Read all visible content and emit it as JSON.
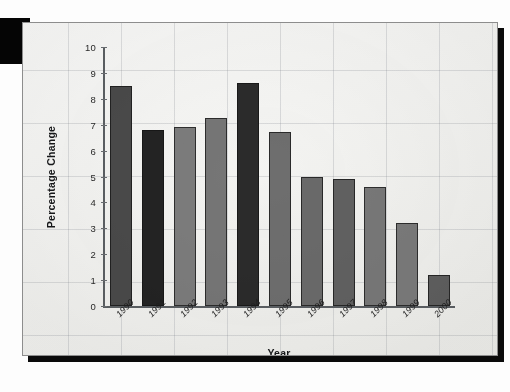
{
  "figure": {
    "title": "",
    "x_axis_label": "Year",
    "y_axis_label": "Percentage Change"
  },
  "chart_data": {
    "type": "bar",
    "title": "",
    "xlabel": "Year",
    "ylabel": "Percentage Change",
    "categories": [
      "1990",
      "1991",
      "1992",
      "1993",
      "1994",
      "1995",
      "1996",
      "1997",
      "1998",
      "1999",
      "2000"
    ],
    "values": [
      8.5,
      6.8,
      6.9,
      7.25,
      8.6,
      6.7,
      5.0,
      4.9,
      4.6,
      3.2,
      1.2
    ],
    "ylim": [
      0,
      10
    ],
    "yticks": [
      0,
      1,
      2,
      3,
      4,
      5,
      6,
      7,
      8,
      9,
      10
    ],
    "ytick_labels": [
      "0",
      "1",
      "2",
      "3",
      "4",
      "5",
      "6",
      "7",
      "8",
      "9",
      "10"
    ],
    "grid": true,
    "legend": "none",
    "bar_colors": [
      "#4a4a4a",
      "#232323",
      "#7c7c7c",
      "#767676",
      "#2b2b2b",
      "#6e6e6e",
      "#6a6a6a",
      "#616161",
      "#787878",
      "#7a7a7a",
      "#5e5e5e"
    ]
  },
  "colors": {
    "page_background": "#fdfdfd",
    "figure_background": "#f2f2ef",
    "frame": "#0a0a0a",
    "axis": "#5b5f63",
    "grid": "#787d87",
    "text": "#1f1f1f"
  }
}
